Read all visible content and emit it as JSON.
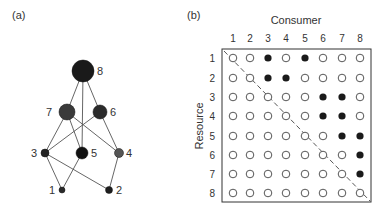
{
  "panel_a": {
    "label": "(a)",
    "nodes": [
      {
        "id": "1",
        "x": 62,
        "y": 190,
        "r": 3,
        "color": "#2a2a2a",
        "lx": 49,
        "ly": 194
      },
      {
        "id": "2",
        "x": 109,
        "y": 190,
        "r": 3.5,
        "color": "#1e1e1e",
        "lx": 116,
        "ly": 194
      },
      {
        "id": "3",
        "x": 45,
        "y": 153,
        "r": 4,
        "color": "#232323",
        "lx": 31,
        "ly": 157
      },
      {
        "id": "4",
        "x": 119,
        "y": 153,
        "r": 4.5,
        "color": "#555555",
        "lx": 126,
        "ly": 157
      },
      {
        "id": "5",
        "x": 82,
        "y": 153,
        "r": 6,
        "color": "#111111",
        "lx": 91,
        "ly": 157
      },
      {
        "id": "6",
        "x": 100,
        "y": 112,
        "r": 7,
        "color": "#2b2b2b",
        "lx": 110,
        "ly": 116
      },
      {
        "id": "7",
        "x": 67,
        "y": 112,
        "r": 8,
        "color": "#3a3a3a",
        "lx": 46,
        "ly": 116
      },
      {
        "id": "8",
        "x": 83,
        "y": 71,
        "r": 11,
        "color": "#1a1a1a",
        "lx": 97,
        "ly": 75
      }
    ],
    "edges": [
      [
        "1",
        "3"
      ],
      [
        "1",
        "5"
      ],
      [
        "2",
        "3"
      ],
      [
        "2",
        "4"
      ],
      [
        "3",
        "6"
      ],
      [
        "3",
        "7"
      ],
      [
        "4",
        "6"
      ],
      [
        "4",
        "7"
      ],
      [
        "5",
        "7"
      ],
      [
        "5",
        "8"
      ],
      [
        "6",
        "8"
      ],
      [
        "7",
        "8"
      ]
    ]
  },
  "panel_b": {
    "label": "(b)",
    "x_title": "Consumer",
    "y_title": "Resource",
    "col_labels": [
      "1",
      "2",
      "3",
      "4",
      "5",
      "6",
      "7",
      "8"
    ],
    "row_labels": [
      "1",
      "2",
      "3",
      "4",
      "5",
      "6",
      "7",
      "8"
    ],
    "matrix": [
      [
        0,
        0,
        1,
        0,
        1,
        0,
        0,
        0
      ],
      [
        0,
        0,
        1,
        1,
        0,
        0,
        0,
        0
      ],
      [
        0,
        0,
        0,
        0,
        0,
        1,
        1,
        0
      ],
      [
        0,
        0,
        0,
        0,
        0,
        1,
        1,
        0
      ],
      [
        0,
        0,
        0,
        0,
        0,
        0,
        1,
        1
      ],
      [
        0,
        0,
        0,
        0,
        0,
        0,
        0,
        1
      ],
      [
        0,
        0,
        0,
        0,
        0,
        0,
        0,
        1
      ],
      [
        0,
        0,
        0,
        0,
        0,
        0,
        0,
        0
      ]
    ],
    "filled_color": "#1a1a1a",
    "empty_stroke": "#444444"
  }
}
